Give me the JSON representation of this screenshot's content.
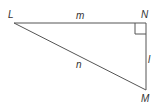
{
  "diagram": {
    "type": "right-triangle",
    "vertices": {
      "L": {
        "label": "L",
        "x": 14,
        "y": 23
      },
      "N": {
        "label": "N",
        "x": 146,
        "y": 23
      },
      "M": {
        "label": "M",
        "x": 146,
        "y": 90
      }
    },
    "sides": {
      "LN": {
        "label": "m"
      },
      "NM": {
        "label": "l"
      },
      "LM": {
        "label": "n"
      }
    },
    "right_angle_at": "N",
    "colors": {
      "line": "#555555",
      "text": "#333333"
    }
  }
}
